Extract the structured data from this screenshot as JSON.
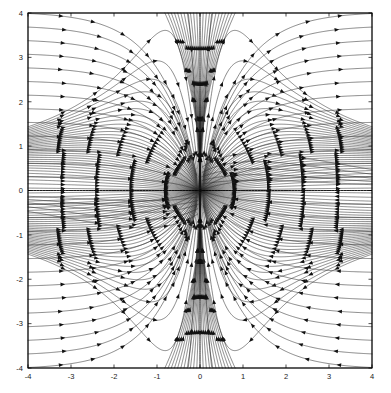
{
  "figure": {
    "kind": "streamplot",
    "title": "",
    "background_color": "#ffffff",
    "frame_color": "#000000",
    "stream_color": "#2b2b2b",
    "arrow_color": "#111111"
  },
  "chart_data": {
    "type": "line",
    "plot_kind": "streamplot",
    "title": "",
    "xlabel": "",
    "ylabel": "",
    "xlim": [
      -4,
      4
    ],
    "ylim": [
      -4,
      4
    ],
    "grid": false,
    "legend": null,
    "xticks": [
      -4,
      -3,
      -2,
      -1,
      0,
      1,
      2,
      3,
      4
    ],
    "yticks": [
      -4,
      -3,
      -2,
      -1,
      0,
      1,
      2,
      3,
      4
    ],
    "xticklabels": [
      "-4",
      "-3",
      "-2",
      "-1",
      "0",
      "1",
      "2",
      "3",
      "4"
    ],
    "yticklabels": [
      "-4",
      "-3",
      "-2",
      "-1",
      "0",
      "1",
      "2",
      "3",
      "4"
    ],
    "critical_points": [
      {
        "x": 0,
        "y": 0,
        "classification": "degenerate-node",
        "label": ""
      }
    ],
    "separatrices": [
      {
        "name": "horizontal-axis",
        "y": 0,
        "direction": "leftward"
      },
      {
        "name": "vertical-axis",
        "x": 0,
        "direction": "outward"
      }
    ],
    "quadrant_arrow_directions": {
      "quadrant_I": "right",
      "quadrant_II": "left",
      "quadrant_III": "left",
      "quadrant_IV": "left"
    },
    "seed_offsets": [
      0.07,
      0.16,
      0.28,
      0.42,
      0.58,
      0.78,
      1.0,
      1.26,
      1.55,
      1.88,
      2.25,
      2.66,
      3.1,
      3.6,
      4.15
    ],
    "arrow_count_per_curve": 9
  }
}
